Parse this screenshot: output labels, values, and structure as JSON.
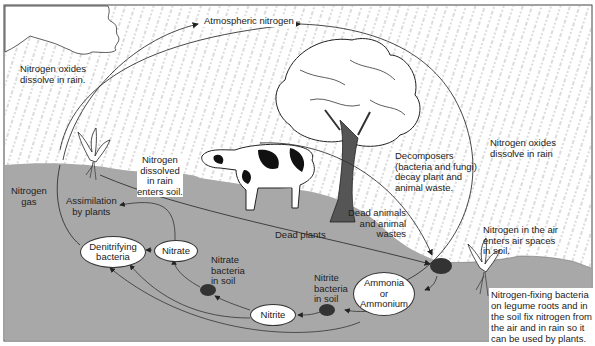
{
  "diagram": {
    "colors": {
      "soil": "#a8a8a8",
      "sky": "#ffffff",
      "rain": "#777777",
      "line": "#333333",
      "border": "#444444"
    },
    "nodes": {
      "atmospheric_nitrogen": "Atmospheric nitrogen",
      "denitrifying_bacteria": "Denitrifying\nbacteria",
      "nitrate": "Nitrate",
      "nitrite": "Nitrite",
      "ammonia": "Ammonia\nor\nAmmonium"
    },
    "labels": {
      "nox_left": "Nitrogen oxides\ndissolve in rain.",
      "nox_right": "Nitrogen oxides\ndissolve in rain",
      "nitrogen_gas": "Nitrogen\ngas",
      "assimilation": "Assimilation\nby plants",
      "dissolved_rain": "Nitrogen\ndissolved\nin rain\nenters soil.",
      "decomposers": "Decomposers\n(bacteria and fungi)\ndecay plant and\nanimal waste.",
      "dead_animals": "Dead animals\nand animal\nwastes",
      "dead_plants": "Dead plants",
      "air_spaces": "Nitrogen in the air\nenters air spaces\nin soil.",
      "nitrate_bacteria": "Nitrate\nbacteria\nin soil",
      "nitrite_bacteria": "Nitrite\nbacteria\nin soil",
      "nitrogen_fixing": "Nitrogen-fixing bacteria\non legume roots and in\nthe soil fix nitrogen from\nthe air and in rain so it\ncan be used by plants."
    },
    "illustrations": [
      "cloud",
      "tree",
      "cow",
      "plant-left",
      "plant-right",
      "bacteria-clump-1",
      "bacteria-clump-2",
      "bacteria-clump-3"
    ]
  }
}
